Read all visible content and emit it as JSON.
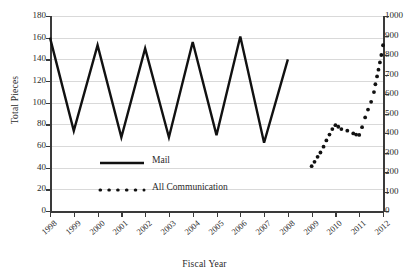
{
  "chart_data": {
    "type": "line",
    "title": "",
    "xlabel": "Fiscal Year",
    "ylabel": "Total Pieces",
    "y2label": "",
    "grid": true,
    "legend_position": "inside-center-left",
    "categories": [
      "1998",
      "1999",
      "2000",
      "2001",
      "2002",
      "2003",
      "2004",
      "2005",
      "2006",
      "2007",
      "2008",
      "2009",
      "2010",
      "2011",
      "2012"
    ],
    "ylim": [
      0,
      180
    ],
    "yticks": [
      0,
      20,
      40,
      60,
      80,
      100,
      120,
      140,
      160,
      180
    ],
    "y2lim": [
      0,
      1000
    ],
    "y2ticks": [
      0,
      100,
      200,
      300,
      400,
      500,
      600,
      700,
      800,
      900,
      1000
    ],
    "series": [
      {
        "name": "Mail",
        "axis": "left",
        "style": "solid",
        "color": "#111111",
        "x": [
          "1998",
          "1999",
          "2000",
          "2001",
          "2002",
          "2003",
          "2004",
          "2005",
          "2006",
          "2007",
          "2008"
        ],
        "values": [
          160,
          74,
          153,
          68,
          150,
          68,
          156,
          70,
          161,
          63,
          140
        ]
      },
      {
        "name": "All Communication",
        "axis": "right",
        "style": "dotted",
        "color": "#111111",
        "x": [
          "2009",
          "2010",
          "2011",
          "2012"
        ],
        "values": [
          230,
          440,
          390,
          850
        ],
        "points": [
          {
            "x": 2009.0,
            "y": 230
          },
          {
            "x": 2009.12,
            "y": 252
          },
          {
            "x": 2009.25,
            "y": 278
          },
          {
            "x": 2009.37,
            "y": 300
          },
          {
            "x": 2009.5,
            "y": 330
          },
          {
            "x": 2009.62,
            "y": 362
          },
          {
            "x": 2009.75,
            "y": 392
          },
          {
            "x": 2009.87,
            "y": 420
          },
          {
            "x": 2010.0,
            "y": 440
          },
          {
            "x": 2010.12,
            "y": 432
          },
          {
            "x": 2010.25,
            "y": 420
          },
          {
            "x": 2010.5,
            "y": 412
          },
          {
            "x": 2010.75,
            "y": 398
          },
          {
            "x": 2010.87,
            "y": 392
          },
          {
            "x": 2011.0,
            "y": 390
          },
          {
            "x": 2011.12,
            "y": 430
          },
          {
            "x": 2011.25,
            "y": 480
          },
          {
            "x": 2011.37,
            "y": 520
          },
          {
            "x": 2011.5,
            "y": 560
          },
          {
            "x": 2011.62,
            "y": 610
          },
          {
            "x": 2011.68,
            "y": 650
          },
          {
            "x": 2011.75,
            "y": 690
          },
          {
            "x": 2011.81,
            "y": 725
          },
          {
            "x": 2011.87,
            "y": 762
          },
          {
            "x": 2011.93,
            "y": 800
          },
          {
            "x": 2012.0,
            "y": 850
          }
        ]
      }
    ]
  },
  "legend": {
    "items": [
      {
        "label": "Mail",
        "style": "solid"
      },
      {
        "label": "All Communication",
        "style": "dotted"
      }
    ]
  }
}
